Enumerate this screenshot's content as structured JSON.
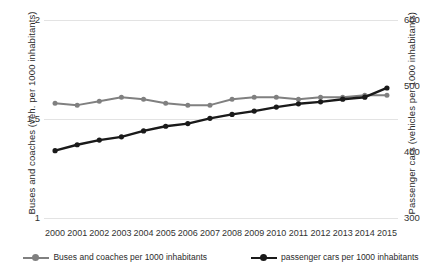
{
  "chart_data": {
    "type": "line",
    "title": "",
    "xlabel": "",
    "categories": [
      "2000",
      "2001",
      "2002",
      "2003",
      "2004",
      "2005",
      "2006",
      "2007",
      "2008",
      "2009",
      "2010",
      "2011",
      "2012",
      "2013",
      "2014",
      "2015"
    ],
    "grid": true,
    "legend_position": "bottom",
    "axes": {
      "left": {
        "label": "Buses and coaches (veh. per 1000 inhabitants)",
        "ticks": [
          "1",
          "1,5",
          "2"
        ],
        "tick_values": [
          1,
          1.5,
          2
        ],
        "ylim": [
          1,
          2
        ]
      },
      "right": {
        "label": "Passenger cars (vehicles per 1000 inhabitants)",
        "ticks": [
          "300",
          "400",
          "500",
          "600"
        ],
        "tick_values": [
          300,
          400,
          500,
          600
        ],
        "ylim": [
          300,
          600
        ]
      }
    },
    "series": [
      {
        "name": "Buses and coaches per 1000 inhabitants",
        "axis": "left",
        "color": "#808080",
        "marker": "circle",
        "values": [
          1.58,
          1.57,
          1.59,
          1.61,
          1.6,
          1.58,
          1.57,
          1.57,
          1.6,
          1.61,
          1.61,
          1.6,
          1.61,
          1.61,
          1.62,
          1.62
        ]
      },
      {
        "name": "passenger cars per 1000 inhabitants",
        "axis": "right",
        "color": "#1a1a1a",
        "marker": "circle",
        "values": [
          402,
          411,
          418,
          423,
          432,
          439,
          443,
          451,
          457,
          462,
          468,
          473,
          476,
          480,
          483,
          497
        ]
      }
    ]
  },
  "legend": {
    "items": [
      {
        "label": "Buses and coaches per 1000 inhabitants",
        "color": "#808080"
      },
      {
        "label": "passenger cars per 1000 inhabitants",
        "color": "#1a1a1a"
      }
    ]
  }
}
